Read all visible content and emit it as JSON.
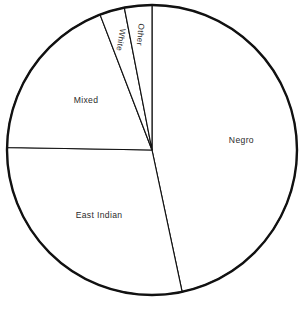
{
  "chart_data": {
    "type": "pie",
    "title": "",
    "subtitle": "",
    "xlabel": "",
    "ylabel": "",
    "legend": "none",
    "grid": false,
    "labels_inside": true,
    "start_angle_deg": 0,
    "direction": "clockwise",
    "categories": [
      "Negro",
      "East Indian",
      "Mixed",
      "White",
      "Other"
    ],
    "values": [
      46.7,
      28.6,
      18.9,
      2.8,
      3.0
    ],
    "slices": [
      {
        "name": "Negro",
        "label": "Negro",
        "value": 46.7,
        "start_angle_deg": 0,
        "end_angle_deg": 168,
        "sweep_deg": 168,
        "label_angle_deg": 84,
        "label_radius_frac": 0.62,
        "label_rotation_deg": 0,
        "fill": "#ffffff",
        "stroke": "#111111"
      },
      {
        "name": "East Indian",
        "label": "East Indian",
        "value": 28.6,
        "start_angle_deg": 168,
        "end_angle_deg": 271,
        "sweep_deg": 103,
        "label_angle_deg": 219,
        "label_radius_frac": 0.58,
        "label_rotation_deg": 0,
        "fill": "#ffffff",
        "stroke": "#111111"
      },
      {
        "name": "Mixed",
        "label": "Mixed",
        "value": 18.9,
        "start_angle_deg": 271,
        "end_angle_deg": 339,
        "sweep_deg": 68,
        "label_angle_deg": 307,
        "label_radius_frac": 0.57,
        "label_rotation_deg": 0,
        "fill": "#ffffff",
        "stroke": "#111111"
      },
      {
        "name": "White",
        "label": "White",
        "value": 2.8,
        "start_angle_deg": 339,
        "end_angle_deg": 349,
        "sweep_deg": 10,
        "label_angle_deg": 344,
        "label_radius_frac": 0.79,
        "label_rotation_deg": 100,
        "fill": "#ffffff",
        "stroke": "#111111"
      },
      {
        "name": "Other",
        "label": "Other",
        "value": 3.0,
        "start_angle_deg": 349,
        "end_angle_deg": 360,
        "sweep_deg": 11,
        "label_angle_deg": 354,
        "label_radius_frac": 0.8,
        "label_rotation_deg": 95,
        "fill": "#ffffff",
        "stroke": "#111111"
      }
    ],
    "geometry": {
      "center_x": 152,
      "center_y": 150,
      "radius": 145,
      "outline_stroke_width": 2.4,
      "divider_stroke_width": 1.15
    },
    "colors": {
      "background": "#ffffff",
      "slice_fill": "#ffffff",
      "outline": "#111111",
      "label_text": "#2b2b2b"
    }
  }
}
